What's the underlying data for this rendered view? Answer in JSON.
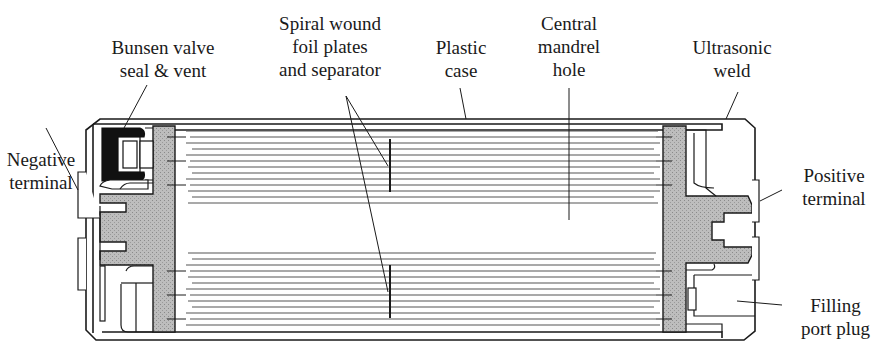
{
  "diagram": {
    "labels": {
      "negative_terminal": [
        "Negative",
        "terminal"
      ],
      "bunsen_valve": [
        "Bunsen valve",
        "seal & vent"
      ],
      "spiral_wound": [
        "Spiral wound",
        "foil plates",
        "and separator"
      ],
      "plastic_case": [
        "Plastic",
        "case"
      ],
      "central_mandrel": [
        "Central",
        "mandrel",
        "hole"
      ],
      "ultrasonic_weld": [
        "Ultrasonic",
        "weld"
      ],
      "positive_terminal": [
        "Positive",
        "terminal"
      ],
      "filling_port_plug": [
        "Filling",
        "port plug"
      ]
    },
    "colors": {
      "line": "#1a1a1a",
      "end_cap_fill": "#b5b5b5",
      "valve_seal": "#111111",
      "background": "#ffffff"
    }
  }
}
